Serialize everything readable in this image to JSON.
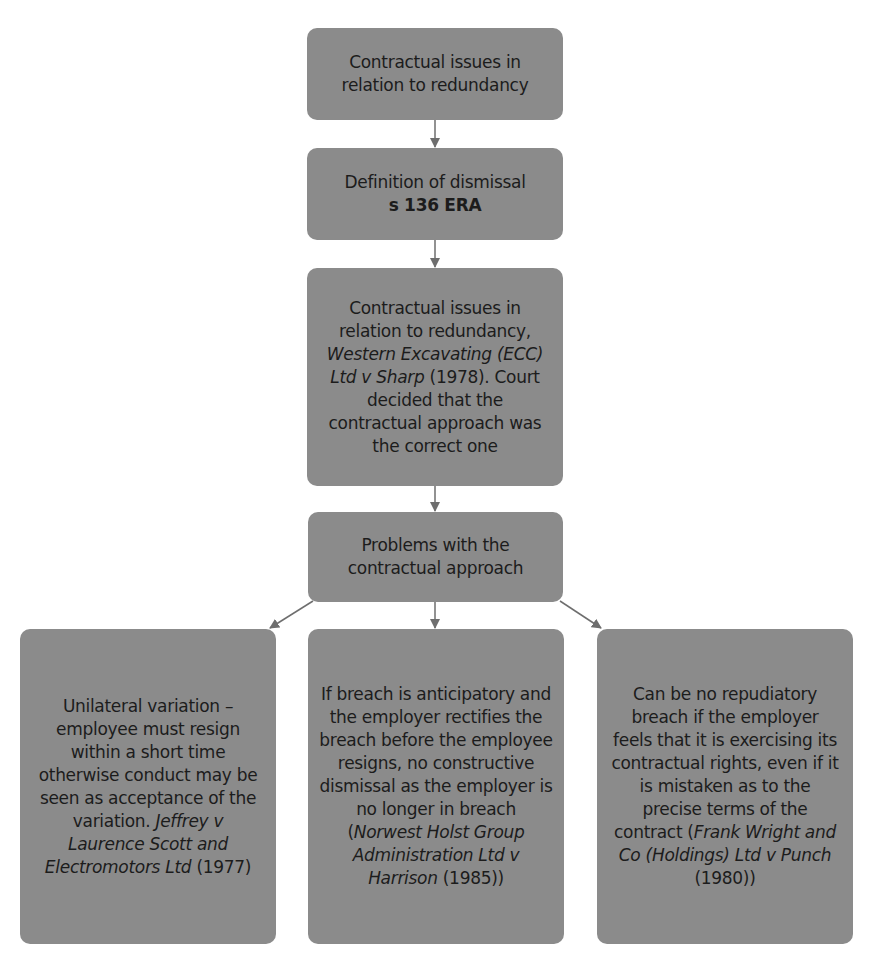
{
  "diagram": {
    "type": "flowchart",
    "colors": {
      "box_fill": "#8b8b8b",
      "arrow": "#6e6e6e",
      "text": "#1c1c1c",
      "background": "#ffffff"
    },
    "nodes": [
      {
        "id": "b1",
        "lines": [
          {
            "parts": [
              {
                "text": "Contractual issues in relation to redundancy"
              }
            ]
          }
        ]
      },
      {
        "id": "b2",
        "lines": [
          {
            "parts": [
              {
                "text": "Definition of dismissal"
              }
            ]
          },
          {
            "parts": [
              {
                "text": "s 136 ERA",
                "bold": true
              }
            ]
          }
        ]
      },
      {
        "id": "b3",
        "lines": [
          {
            "parts": [
              {
                "text": "Contractual issues in relation to redundancy, "
              },
              {
                "text": "Western Excavating (ECC) Ltd v Sharp",
                "italic": true
              },
              {
                "text": " (1978). Court decided that the contractual approach was the correct one"
              }
            ]
          }
        ]
      },
      {
        "id": "b4",
        "lines": [
          {
            "parts": [
              {
                "text": "Problems with the contractual approach"
              }
            ]
          }
        ]
      },
      {
        "id": "b5",
        "lines": [
          {
            "parts": [
              {
                "text": "Unilateral variation – employee must resign within a short time otherwise conduct may be seen as acceptance of the variation. "
              },
              {
                "text": "Jeffrey v Laurence Scott and Electromotors Ltd",
                "italic": true
              },
              {
                "text": " (1977)"
              }
            ]
          }
        ]
      },
      {
        "id": "b6",
        "lines": [
          {
            "parts": [
              {
                "text": "If breach is anticipatory and the employer rectifies the breach before the employee resigns, no constructive dismissal as the employer is no longer in breach ("
              },
              {
                "text": "Norwest Holst Group Administration Ltd v Harrison",
                "italic": true
              },
              {
                "text": " (1985))"
              }
            ]
          }
        ]
      },
      {
        "id": "b7",
        "lines": [
          {
            "parts": [
              {
                "text": "Can be no repudiatory breach if the employer feels that it is exercising its contractual rights, even if it is mistaken as to the precise terms of the contract ("
              },
              {
                "text": "Frank Wright and Co (Holdings) Ltd v Punch",
                "italic": true
              },
              {
                "text": " (1980))"
              }
            ]
          }
        ]
      }
    ],
    "edges": [
      {
        "from": "b1",
        "to": "b2"
      },
      {
        "from": "b2",
        "to": "b3"
      },
      {
        "from": "b3",
        "to": "b4"
      },
      {
        "from": "b4",
        "to": "b5"
      },
      {
        "from": "b4",
        "to": "b6"
      },
      {
        "from": "b4",
        "to": "b7"
      }
    ]
  }
}
